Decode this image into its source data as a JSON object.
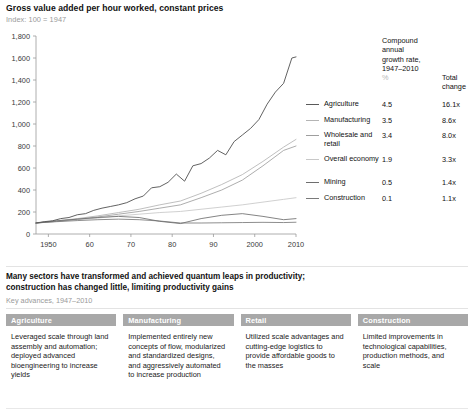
{
  "chart_data": {
    "type": "line",
    "title": "Gross value added per hour worked, constant prices",
    "subtitle": "Index: 100 = 1947",
    "xlabel": "",
    "ylabel": "",
    "ylim": [
      0,
      1800
    ],
    "xlim": [
      1947,
      2010
    ],
    "ytick_labels": [
      "0",
      "200",
      "400",
      "600",
      "800",
      "1,000",
      "1,200",
      "1,400",
      "1,600",
      "1,800"
    ],
    "ytick_values": [
      0,
      200,
      400,
      600,
      800,
      1000,
      1200,
      1400,
      1600,
      1800
    ],
    "xtick_labels": [
      "1950",
      "60",
      "70",
      "80",
      "90",
      "2000",
      "2010"
    ],
    "xtick_values": [
      1950,
      1960,
      1970,
      1980,
      1990,
      2000,
      2010
    ],
    "grid": false,
    "legend_position": "right",
    "series": [
      {
        "name": "Agriculture",
        "color": "#5a5a5a",
        "cagr": "4.5",
        "total_change": "16.1x",
        "x": [
          1947,
          1949,
          1951,
          1953,
          1955,
          1957,
          1959,
          1961,
          1963,
          1965,
          1967,
          1969,
          1971,
          1973,
          1975,
          1977,
          1979,
          1981,
          1983,
          1985,
          1987,
          1989,
          1991,
          1993,
          1995,
          1997,
          1999,
          2001,
          2003,
          2005,
          2007,
          2009,
          2010
        ],
        "values": [
          100,
          112,
          120,
          140,
          150,
          175,
          185,
          215,
          235,
          250,
          265,
          285,
          320,
          345,
          420,
          430,
          470,
          545,
          480,
          620,
          640,
          690,
          760,
          720,
          840,
          900,
          960,
          1040,
          1180,
          1290,
          1370,
          1600,
          1610
        ]
      },
      {
        "name": "Manufacturing",
        "color": "#b4b4b4",
        "cagr": "3.5",
        "total_change": "8.6x",
        "x": [
          1947,
          1952,
          1957,
          1962,
          1967,
          1972,
          1977,
          1982,
          1987,
          1992,
          1997,
          2002,
          2007,
          2010
        ],
        "values": [
          100,
          120,
          140,
          165,
          195,
          225,
          265,
          300,
          370,
          450,
          540,
          660,
          790,
          860
        ]
      },
      {
        "name": "Wholesale and retail",
        "color": "#9e9e9e",
        "cagr": "3.4",
        "total_change": "8.0x",
        "x": [
          1947,
          1952,
          1957,
          1962,
          1967,
          1972,
          1977,
          1982,
          1987,
          1992,
          1997,
          2002,
          2007,
          2010
        ],
        "values": [
          100,
          115,
          135,
          155,
          180,
          205,
          235,
          265,
          330,
          400,
          490,
          620,
          760,
          800
        ]
      },
      {
        "name": "Overall economy",
        "color": "#c8c8c8",
        "cagr": "1.9",
        "total_change": "3.3x",
        "x": [
          1947,
          1952,
          1957,
          1962,
          1967,
          1972,
          1977,
          1982,
          1987,
          1992,
          1997,
          2002,
          2007,
          2010
        ],
        "values": [
          100,
          115,
          130,
          145,
          165,
          180,
          195,
          205,
          225,
          245,
          265,
          290,
          315,
          330
        ]
      },
      {
        "name": "Mining",
        "color": "#6e6e6e",
        "cagr": "0.5",
        "total_change": "1.4x",
        "x": [
          1947,
          1952,
          1957,
          1962,
          1967,
          1972,
          1977,
          1982,
          1987,
          1992,
          1997,
          2002,
          2007,
          2010
        ],
        "values": [
          100,
          120,
          135,
          150,
          160,
          150,
          115,
          95,
          140,
          170,
          185,
          160,
          130,
          140
        ]
      },
      {
        "name": "Construction",
        "color": "#7a7a7a",
        "cagr": "0.1",
        "total_change": "1.1x",
        "x": [
          1947,
          1952,
          1957,
          1962,
          1967,
          1972,
          1977,
          1982,
          1987,
          1992,
          1997,
          2002,
          2007,
          2010
        ],
        "values": [
          100,
          112,
          122,
          130,
          135,
          130,
          118,
          100,
          100,
          102,
          104,
          106,
          104,
          107
        ]
      }
    ]
  },
  "legend": {
    "cagr_header_line1": "Compound",
    "cagr_header_line2": "annual",
    "cagr_header_line3": "growth rate,",
    "cagr_header_line4": "1947–2010",
    "cagr_header_unit": "%",
    "total_header_line1": "Total",
    "total_header_line2": "change"
  },
  "lower": {
    "title_line1": "Many sectors have transformed and achieved quantum leaps in productivity;",
    "title_line2": "construction has changed little, limiting productivity gains",
    "subtitle": "Key advances, 1947–2010",
    "panels": [
      {
        "header": "Agriculture",
        "body": "Leveraged scale through land assembly and automation; deployed advanced bioengineering to increase yields"
      },
      {
        "header": "Manufacturing",
        "body": "Implemented entirely new concepts of flow, modularized and standardized designs, and aggressively automated to increase production"
      },
      {
        "header": "Retail",
        "body": "Utilized scale advantages and cutting-edge logistics to provide affordable goods to the masses"
      },
      {
        "header": "Construction",
        "body": "Limited improvements in technological capabilities, production methods, and scale"
      }
    ]
  },
  "colors": {
    "panel_header_bg": "#a8a8a8",
    "axis": "#8c8c8c",
    "muted_text": "#9a9a9a"
  }
}
